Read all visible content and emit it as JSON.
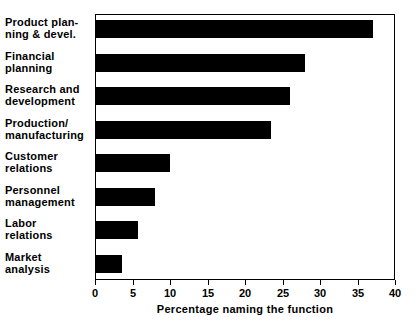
{
  "chart_data": {
    "type": "bar",
    "orientation": "horizontal",
    "title": "",
    "xlabel": "Percentage naming the function",
    "ylabel": "",
    "xlim": [
      0,
      40
    ],
    "xticks": [
      0,
      5,
      10,
      15,
      20,
      25,
      30,
      35,
      40
    ],
    "xtick_labels": [
      "0",
      "5",
      "10",
      "15",
      "20",
      "25",
      "30",
      "35",
      "40"
    ],
    "grid": false,
    "legend": null,
    "bar_color": "#000000",
    "background_color": "#ffffff",
    "frame_color": "#000000",
    "categories": [
      "Product plan-\nning & devel.",
      "Financial\nplanning",
      "Research and\ndevelopment",
      "Production/\nmanufacturing",
      "Customer\nrelations",
      "Personnel\nmanagement",
      "Labor\nrelations",
      "Market\nanalysis"
    ],
    "values": [
      37,
      28,
      26,
      23.5,
      10,
      8,
      5.7,
      3.6
    ]
  }
}
